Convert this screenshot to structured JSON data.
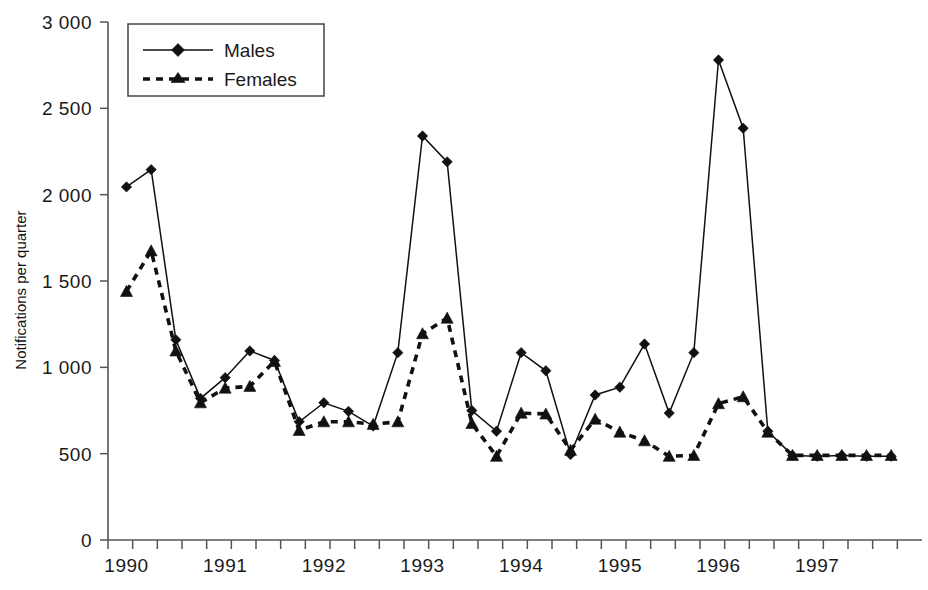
{
  "chart_data": {
    "type": "line",
    "title": "",
    "xlabel": "",
    "ylabel": "Notifications per quarter",
    "ylim": [
      0,
      3000
    ],
    "yticks": [
      0,
      500,
      1000,
      1500,
      2000,
      2500,
      3000
    ],
    "ytick_labels": [
      "0",
      "500",
      "1 000",
      "1 500",
      "2 000",
      "2 500",
      "3 000"
    ],
    "xtick_labels": [
      "1990",
      "1991",
      "1992",
      "1993",
      "1994",
      "1995",
      "1996",
      "1997"
    ],
    "x_quarters": [
      "1990 Q1",
      "1990 Q2",
      "1990 Q3",
      "1990 Q4",
      "1991 Q1",
      "1991 Q2",
      "1991 Q3",
      "1991 Q4",
      "1992 Q1",
      "1992 Q2",
      "1992 Q3",
      "1992 Q4",
      "1993 Q1",
      "1993 Q2",
      "1993 Q3",
      "1993 Q4",
      "1994 Q1",
      "1994 Q2",
      "1994 Q3",
      "1994 Q4",
      "1995 Q1",
      "1995 Q2",
      "1995 Q3",
      "1995 Q4",
      "1996 Q1",
      "1996 Q2",
      "1996 Q3",
      "1996 Q4",
      "1997 Q1",
      "1997 Q2",
      "1997 Q3",
      "1997 Q4"
    ],
    "grid": false,
    "legend_position": "top-left",
    "series": [
      {
        "name": "Males",
        "marker": "diamond",
        "linestyle": "solid",
        "color": "#111111",
        "values": [
          2045,
          2145,
          1160,
          820,
          940,
          1095,
          1040,
          685,
          795,
          745,
          660,
          1085,
          2340,
          2190,
          750,
          630,
          1085,
          980,
          495,
          840,
          885,
          1135,
          735,
          1085,
          2780,
          2385,
          630,
          490,
          485,
          490,
          485,
          485
        ]
      },
      {
        "name": "Females",
        "marker": "triangle",
        "linestyle": "dashed",
        "color": "#111111",
        "values": [
          1440,
          1675,
          1095,
          795,
          880,
          890,
          1035,
          635,
          685,
          685,
          670,
          685,
          1195,
          1285,
          675,
          485,
          735,
          730,
          520,
          700,
          625,
          575,
          485,
          490,
          790,
          830,
          625,
          490,
          490,
          490,
          490,
          490
        ]
      }
    ]
  },
  "legend": {
    "entries": [
      {
        "label": "Males"
      },
      {
        "label": "Females"
      }
    ]
  }
}
